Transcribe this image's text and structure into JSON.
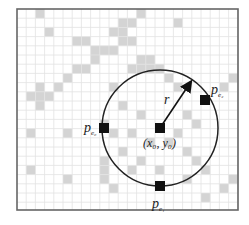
{
  "figure": {
    "frame": {
      "x": 17,
      "y": 9,
      "width": 221,
      "height": 201
    },
    "grid": {
      "cell": 9.2,
      "line_color": "#e2e2e2",
      "fill_color": "#d4d4d4"
    },
    "circle": {
      "cx": 160,
      "cy": 128,
      "r": 58,
      "stroke": "#222222"
    },
    "center_label": "(x₀, y₀)",
    "radius_label": "r",
    "points": [
      {
        "name": "p_e0",
        "label": "p",
        "sub": "e₀",
        "x": 104,
        "y": 128
      },
      {
        "name": "p_e1",
        "label": "p",
        "sub": "e₁",
        "x": 160,
        "y": 186
      },
      {
        "name": "p_e2",
        "label": "p",
        "sub": "e₂",
        "x": 205,
        "y": 100
      },
      {
        "name": "center",
        "x": 160,
        "y": 128
      }
    ],
    "shaded_cells": [
      [
        10,
        2
      ],
      [
        13,
        0
      ],
      [
        17,
        1
      ],
      [
        10,
        4
      ],
      [
        11,
        3
      ],
      [
        13,
        5
      ],
      [
        14,
        5
      ],
      [
        3,
        2
      ],
      [
        6,
        3
      ],
      [
        7,
        3
      ],
      [
        2,
        0
      ],
      [
        8,
        4
      ],
      [
        9,
        4
      ],
      [
        1,
        9
      ],
      [
        2,
        9
      ],
      [
        3,
        9
      ],
      [
        2,
        8
      ],
      [
        2,
        10
      ],
      [
        4,
        8
      ],
      [
        5,
        7
      ],
      [
        6,
        6
      ],
      [
        7,
        6
      ],
      [
        8,
        5
      ],
      [
        11,
        1
      ],
      [
        12,
        1
      ],
      [
        11,
        2
      ],
      [
        12,
        3
      ],
      [
        22,
        8
      ],
      [
        23,
        7
      ],
      [
        1,
        13
      ],
      [
        5,
        13
      ],
      [
        9,
        12
      ],
      [
        1,
        17
      ],
      [
        5,
        18
      ],
      [
        9,
        16
      ],
      [
        9,
        17
      ],
      [
        9,
        18
      ],
      [
        10,
        19
      ],
      [
        12,
        6
      ],
      [
        13,
        6
      ],
      [
        14,
        6
      ],
      [
        15,
        6
      ],
      [
        16,
        7
      ],
      [
        17,
        8
      ],
      [
        10,
        8
      ],
      [
        11,
        10
      ],
      [
        13,
        11
      ],
      [
        18,
        11
      ],
      [
        12,
        13
      ],
      [
        14,
        14
      ],
      [
        16,
        14
      ],
      [
        17,
        13
      ],
      [
        18,
        15
      ],
      [
        19,
        16
      ],
      [
        13,
        16
      ],
      [
        15,
        17
      ],
      [
        20,
        17
      ],
      [
        22,
        19
      ],
      [
        23,
        18
      ],
      [
        18,
        18
      ],
      [
        20,
        20
      ],
      [
        11,
        15
      ],
      [
        12,
        17
      ],
      [
        10,
        13
      ],
      [
        19,
        12
      ]
    ]
  }
}
